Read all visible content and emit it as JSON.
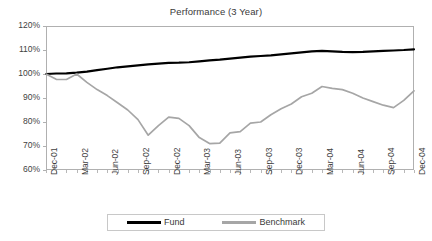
{
  "chart_data": {
    "type": "line",
    "title": "Performance (3 Year)",
    "xlabel": "",
    "ylabel": "",
    "ylim": [
      60,
      120
    ],
    "ytick_labels": [
      "120%",
      "110%",
      "100%",
      "90%",
      "80%",
      "70%",
      "60%"
    ],
    "ytick_values": [
      120,
      110,
      100,
      90,
      80,
      70,
      60
    ],
    "grid": true,
    "legend_position": "bottom",
    "x": [
      "Dec-01",
      "Jan-02",
      "Feb-02",
      "Mar-02",
      "Apr-02",
      "May-02",
      "Jun-02",
      "Jul-02",
      "Aug-02",
      "Sep-02",
      "Oct-02",
      "Nov-02",
      "Dec-02",
      "Jan-03",
      "Feb-03",
      "Mar-03",
      "Apr-03",
      "May-03",
      "Jun-03",
      "Jul-03",
      "Aug-03",
      "Sep-03",
      "Oct-03",
      "Nov-03",
      "Dec-03",
      "Jan-04",
      "Feb-04",
      "Mar-04",
      "Apr-04",
      "May-04",
      "Jun-04",
      "Jul-04",
      "Aug-04",
      "Sep-04",
      "Oct-04",
      "Nov-04",
      "Dec-04"
    ],
    "xtick_labels": [
      "Dec-01",
      "Mar-02",
      "Jun-02",
      "Sep-02",
      "Dec-02",
      "Mar-03",
      "Jun-03",
      "Sep-03",
      "Dec-03",
      "Mar-04",
      "Jun-04",
      "Sep-04",
      "Dec-04"
    ],
    "xtick_indices": [
      0,
      3,
      6,
      9,
      12,
      15,
      18,
      21,
      24,
      27,
      30,
      33,
      36
    ],
    "series": [
      {
        "name": "Fund",
        "color": "#000000",
        "width": 2.2,
        "values": [
          100.0,
          100.2,
          100.3,
          100.6,
          101.0,
          101.6,
          102.2,
          102.8,
          103.2,
          103.6,
          104.0,
          104.3,
          104.6,
          104.7,
          104.9,
          105.3,
          105.7,
          106.0,
          106.4,
          106.8,
          107.2,
          107.5,
          107.8,
          108.2,
          108.6,
          109.0,
          109.4,
          109.6,
          109.4,
          109.2,
          109.1,
          109.2,
          109.4,
          109.6,
          109.8,
          110.0,
          110.3
        ]
      },
      {
        "name": "Benchmark",
        "color": "#a6a6a6",
        "width": 1.7,
        "values": [
          100.0,
          97.8,
          97.7,
          100.0,
          96.5,
          93.5,
          91.0,
          88.0,
          85.0,
          81.0,
          74.5,
          78.5,
          82.0,
          81.5,
          78.5,
          73.5,
          71.0,
          71.2,
          75.5,
          76.0,
          79.5,
          80.0,
          83.0,
          85.5,
          87.5,
          90.5,
          92.0,
          94.8,
          94.0,
          93.5,
          92.0,
          90.0,
          88.5,
          87.0,
          86.0,
          89.0,
          93.0
        ]
      }
    ]
  },
  "legend": {
    "items": [
      {
        "label": "Fund"
      },
      {
        "label": "Benchmark"
      }
    ]
  }
}
